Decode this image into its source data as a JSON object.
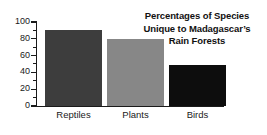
{
  "chart_data": {
    "type": "bar",
    "title_lines": [
      "Percentages of Species",
      "Unique to Madagascar’s",
      "Rain Forests"
    ],
    "categories": [
      "Reptiles",
      "Plants",
      "Birds"
    ],
    "values": [
      90,
      80,
      49
    ],
    "series": [
      {
        "name": "Percentage unique",
        "values": [
          90,
          80,
          49
        ]
      }
    ],
    "xlabel": "",
    "ylabel": "",
    "ylim": [
      0,
      100
    ],
    "ytick_labels": [
      "0",
      "20",
      "40",
      "60",
      "80",
      "100"
    ],
    "ytick_values": [
      0,
      20,
      40,
      60,
      80,
      100
    ],
    "yminor_step": 10,
    "grid": false,
    "legend": false,
    "legend_position": "none",
    "bar_colors": [
      "#3d3d3d",
      "#878787",
      "#0d0d0d"
    ],
    "background_color": "#ffffff",
    "axis_color": "#1a1a1a",
    "title_color": "#111111"
  }
}
